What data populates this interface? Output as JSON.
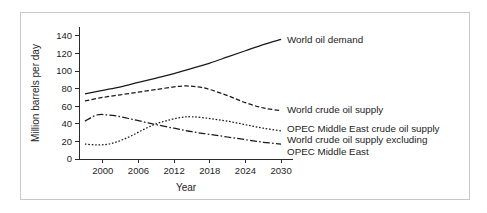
{
  "chart_data": {
    "type": "line",
    "title": "",
    "xlabel": "Year",
    "ylabel": "Million barrels per day",
    "xlim": [
      1996,
      2032
    ],
    "ylim": [
      0,
      150
    ],
    "xticks": [
      2000,
      2006,
      2012,
      2018,
      2024,
      2030
    ],
    "xtick_labels": [
      "2000",
      "2006",
      "2012",
      "2018",
      "2024",
      "2030"
    ],
    "yticks": [
      0,
      20,
      40,
      60,
      80,
      100,
      120,
      140
    ],
    "ytick_labels": [
      "0",
      "20",
      "40",
      "60",
      "80",
      "100",
      "120",
      "140"
    ],
    "grid": false,
    "legend_position": "right-inline-annotations",
    "series": [
      {
        "name": "World oil demand",
        "style": "solid",
        "label": "World oil demand",
        "label_x": 2031,
        "label_y": 136,
        "x": [
          1997,
          2000,
          2003,
          2006,
          2009,
          2012,
          2015,
          2018,
          2021,
          2024,
          2027,
          2030
        ],
        "values": [
          74,
          78,
          82,
          87,
          92,
          97,
          103,
          109,
          116,
          123,
          130,
          136
        ]
      },
      {
        "name": "World crude oil supply",
        "style": "dashed",
        "label": "World crude oil supply",
        "label_x": 2031,
        "label_y": 56,
        "x": [
          1997,
          2000,
          2003,
          2006,
          2009,
          2012,
          2014,
          2016,
          2018,
          2021,
          2024,
          2027,
          2030
        ],
        "values": [
          66,
          70,
          73,
          76,
          79,
          82,
          83,
          82,
          79,
          72,
          64,
          58,
          55
        ]
      },
      {
        "name": "OPEC Middle East crude oil supply",
        "style": "dotted",
        "label": "OPEC Middle East crude oil supply",
        "label_x": 2031,
        "label_y": 34,
        "x": [
          1997,
          1999,
          2001,
          2003,
          2005,
          2007,
          2009,
          2011,
          2013,
          2015,
          2018,
          2021,
          2024,
          2027,
          2030
        ],
        "values": [
          17,
          16,
          17,
          21,
          27,
          34,
          40,
          44,
          47,
          48,
          46,
          43,
          39,
          35,
          32
        ]
      },
      {
        "name": "World crude oil supply excluding OPEC Middle East",
        "style": "dashdot",
        "label_line_1": "World crude oil supply excluding",
        "label_line_2": "OPEC Middle East",
        "label_x": 2031,
        "label_y": 22,
        "label2_y": 8,
        "x": [
          1997,
          1999,
          2001,
          2003,
          2005,
          2007,
          2009,
          2012,
          2015,
          2018,
          2021,
          2024,
          2027,
          2030
        ],
        "values": [
          43,
          50,
          50,
          48,
          45,
          42,
          39,
          35,
          31,
          28,
          25,
          22,
          19,
          17
        ]
      }
    ]
  }
}
